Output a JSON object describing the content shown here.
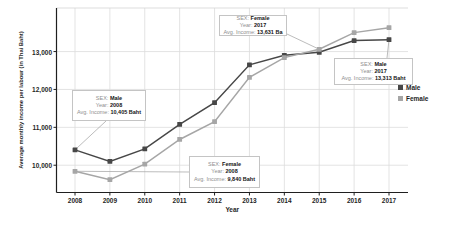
{
  "figure": {
    "background": "#ffffff"
  },
  "colors": {
    "male": "#474747",
    "female": "#a6a6a6",
    "gridline": "#dcdcdc",
    "frame": "#d4d4d4",
    "axis": "#1f1f1f",
    "leader": "#ababab",
    "annotation_border": "#c4c4c4"
  },
  "chart_data": {
    "type": "line",
    "title": "",
    "xlabel": "Year",
    "ylabel": "Average monthly income per labour (in Thai Baht)",
    "x": [
      "2008",
      "2009",
      "2010",
      "2011",
      "2012",
      "2013",
      "2014",
      "2015",
      "2016",
      "2017"
    ],
    "y_ticks": [
      10000,
      11000,
      12000,
      13000
    ],
    "y_tick_labels": [
      "10,000",
      "11,000",
      "12,000",
      "13,000"
    ],
    "ylim": [
      9280,
      14150
    ],
    "grid": true,
    "legend_position": "right",
    "marker": "square",
    "series": [
      {
        "name": "Male",
        "color": "#474747",
        "values": [
          10405,
          10100,
          10430,
          11080,
          11650,
          12650,
          12900,
          12980,
          13290,
          13313
        ]
      },
      {
        "name": "Female",
        "color": "#a6a6a6",
        "values": [
          9840,
          9620,
          10030,
          10680,
          11150,
          12320,
          12840,
          13060,
          13500,
          13631
        ]
      }
    ],
    "annotations": [
      {
        "series": "Female",
        "year": "2017",
        "rows": [
          {
            "label": "SEX: ",
            "value": "Female"
          },
          {
            "label": "Year: ",
            "value": "2017"
          },
          {
            "label": "Avg. Income: ",
            "value": "13,631 Ba"
          }
        ]
      },
      {
        "series": "Male",
        "year": "2008",
        "rows": [
          {
            "label": "SEX: ",
            "value": "Male"
          },
          {
            "label": "Year: ",
            "value": "2008"
          },
          {
            "label": "Avg. Income: ",
            "value": "10,405 Baht"
          }
        ]
      },
      {
        "series": "Female",
        "year": "2008",
        "rows": [
          {
            "label": "SEX: ",
            "value": "Female"
          },
          {
            "label": "Year: ",
            "value": "2008"
          },
          {
            "label": "Avg. Income: ",
            "value": "9,840 Baht"
          }
        ]
      },
      {
        "series": "Male",
        "year": "2017",
        "rows": [
          {
            "label": "SEX: ",
            "value": "Male"
          },
          {
            "label": "Year: ",
            "value": "2017"
          },
          {
            "label": "Avg. Income: ",
            "value": "13,313 Baht"
          }
        ]
      }
    ]
  }
}
